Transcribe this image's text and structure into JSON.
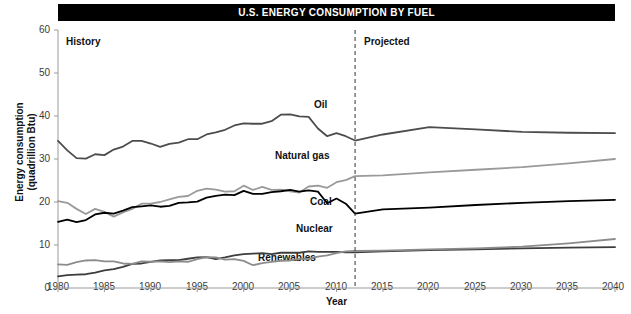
{
  "title": "U.S. ENERGY CONSUMPTION BY FUEL",
  "axis": {
    "ylabel_line1": "Energy consumption",
    "ylabel_line2": "(quadrillion Btu)",
    "xlabel": "Year"
  },
  "regions": {
    "history": "History",
    "projected": "Projected"
  },
  "series_labels": {
    "oil": "Oil",
    "natural_gas": "Natural gas",
    "coal": "Coal",
    "nuclear": "Nuclear",
    "renewables": "Renewables"
  },
  "colors": {
    "title_bar": "#000000",
    "title_text": "#ffffff",
    "oil": "#4d4d4d",
    "natural_gas": "#9a9a9a",
    "coal": "#000000",
    "nuclear": "#3d3d3d",
    "renewables": "#8c8c8c",
    "axis": "#9a9a9a",
    "divider": "#333333"
  },
  "chart_data": {
    "type": "line",
    "title": "U.S. ENERGY CONSUMPTION BY FUEL",
    "xlabel": "Year",
    "ylabel": "Energy consumption (quadrillion Btu)",
    "xlim": [
      1980,
      2040
    ],
    "ylim": [
      0,
      60
    ],
    "xticks": [
      1980,
      1985,
      1990,
      1995,
      2000,
      2005,
      2010,
      2015,
      2020,
      2025,
      2030,
      2035,
      2040
    ],
    "yticks": [
      0,
      10,
      20,
      30,
      40,
      50,
      60
    ],
    "grid": false,
    "legend_position": "inline-labels",
    "annotations": [
      {
        "text": "History",
        "x": 1982,
        "y": 57
      },
      {
        "text": "Projected",
        "x": 2014,
        "y": 57
      }
    ],
    "projection_divider_x": 2012,
    "x": [
      1980,
      1981,
      1982,
      1983,
      1984,
      1985,
      1986,
      1987,
      1988,
      1989,
      1990,
      1991,
      1992,
      1993,
      1994,
      1995,
      1996,
      1997,
      1998,
      1999,
      2000,
      2001,
      2002,
      2003,
      2004,
      2005,
      2006,
      2007,
      2008,
      2009,
      2010,
      2011,
      2012,
      2015,
      2020,
      2025,
      2030,
      2035,
      2040
    ],
    "series": [
      {
        "name": "Oil",
        "color": "#4d4d4d",
        "values": [
          34.2,
          32.0,
          30.2,
          30.1,
          31.1,
          30.9,
          32.2,
          32.9,
          34.2,
          34.2,
          33.6,
          32.8,
          33.5,
          33.8,
          34.6,
          34.6,
          35.7,
          36.2,
          36.8,
          37.8,
          38.3,
          38.2,
          38.2,
          38.8,
          40.3,
          40.4,
          39.9,
          39.8,
          37.1,
          35.3,
          36.0,
          35.3,
          34.3,
          35.7,
          37.4,
          36.9,
          36.3,
          36.1,
          36.0
        ]
      },
      {
        "name": "Natural gas",
        "color": "#9a9a9a",
        "values": [
          20.2,
          19.8,
          18.4,
          17.2,
          18.4,
          17.7,
          16.6,
          17.6,
          18.4,
          19.6,
          19.6,
          20.0,
          20.6,
          21.2,
          21.4,
          22.6,
          23.1,
          22.9,
          22.4,
          22.5,
          23.8,
          22.8,
          23.5,
          22.8,
          22.9,
          22.5,
          22.2,
          23.6,
          23.8,
          23.3,
          24.6,
          25.1,
          26.0,
          26.2,
          26.9,
          27.5,
          28.1,
          29.0,
          30.0
        ]
      },
      {
        "name": "Coal",
        "color": "#000000",
        "values": [
          15.4,
          15.9,
          15.3,
          15.8,
          17.1,
          17.5,
          17.3,
          18.0,
          18.8,
          19.0,
          19.2,
          18.9,
          19.1,
          19.8,
          19.9,
          20.1,
          21.0,
          21.4,
          21.7,
          21.6,
          22.6,
          21.9,
          21.9,
          22.3,
          22.5,
          22.8,
          22.4,
          22.7,
          22.4,
          19.7,
          20.8,
          19.6,
          17.3,
          18.3,
          18.7,
          19.3,
          19.8,
          20.2,
          20.5
        ]
      },
      {
        "name": "Nuclear",
        "color": "#3d3d3d",
        "values": [
          2.7,
          3.0,
          3.1,
          3.2,
          3.6,
          4.1,
          4.4,
          4.9,
          5.6,
          5.7,
          6.1,
          6.4,
          6.5,
          6.5,
          6.8,
          7.1,
          7.2,
          6.7,
          7.1,
          7.6,
          7.9,
          8.0,
          8.1,
          7.9,
          8.2,
          8.2,
          8.2,
          8.5,
          8.4,
          8.4,
          8.4,
          8.3,
          8.3,
          8.5,
          8.8,
          9.0,
          9.2,
          9.4,
          9.5
        ]
      },
      {
        "name": "Renewables",
        "color": "#8c8c8c",
        "values": [
          5.5,
          5.4,
          6.0,
          6.4,
          6.5,
          6.2,
          6.2,
          5.7,
          5.6,
          6.2,
          6.1,
          6.2,
          6.0,
          6.2,
          6.1,
          6.7,
          7.2,
          7.1,
          6.6,
          6.7,
          6.3,
          5.3,
          5.8,
          6.1,
          6.3,
          6.4,
          6.8,
          6.8,
          7.3,
          7.6,
          8.1,
          8.5,
          8.6,
          8.7,
          9.0,
          9.2,
          9.6,
          10.4,
          11.4
        ]
      }
    ]
  }
}
